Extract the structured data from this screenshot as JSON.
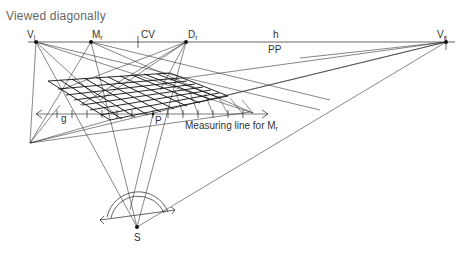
{
  "title": "Viewed diagonally",
  "points": {
    "vl": {
      "label": "V",
      "sub": "l",
      "x": 36,
      "y": 42
    },
    "mr": {
      "label": "M",
      "sub": "r",
      "x": 91,
      "y": 42
    },
    "cv": {
      "label": "CV",
      "x": 138,
      "y": 42
    },
    "dr": {
      "label": "D",
      "sub": "r",
      "x": 186,
      "y": 42
    },
    "vr": {
      "label": "V",
      "sub": "r",
      "x": 446,
      "y": 42
    },
    "s": {
      "label": "S",
      "x": 137,
      "y": 227
    },
    "p": {
      "label": "P",
      "x": 153,
      "y": 115
    }
  },
  "horizon": {
    "label": "h",
    "plane_label": "PP"
  },
  "measuring_line": {
    "label": "Measuring line for M",
    "sub": "r"
  },
  "g_label": "g"
}
